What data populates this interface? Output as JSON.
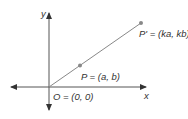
{
  "diagram": {
    "axes": {
      "x_label": "x",
      "y_label": "y"
    },
    "points": [
      {
        "name": "O",
        "label": "O = (0, 0)"
      },
      {
        "name": "P",
        "label": "P = (a, b)"
      },
      {
        "name": "P'",
        "label": "P' = (ka, kb)"
      }
    ],
    "colors": {
      "axis": "#333333",
      "line": "#888888",
      "point": "#888888",
      "text": "#333333"
    }
  }
}
